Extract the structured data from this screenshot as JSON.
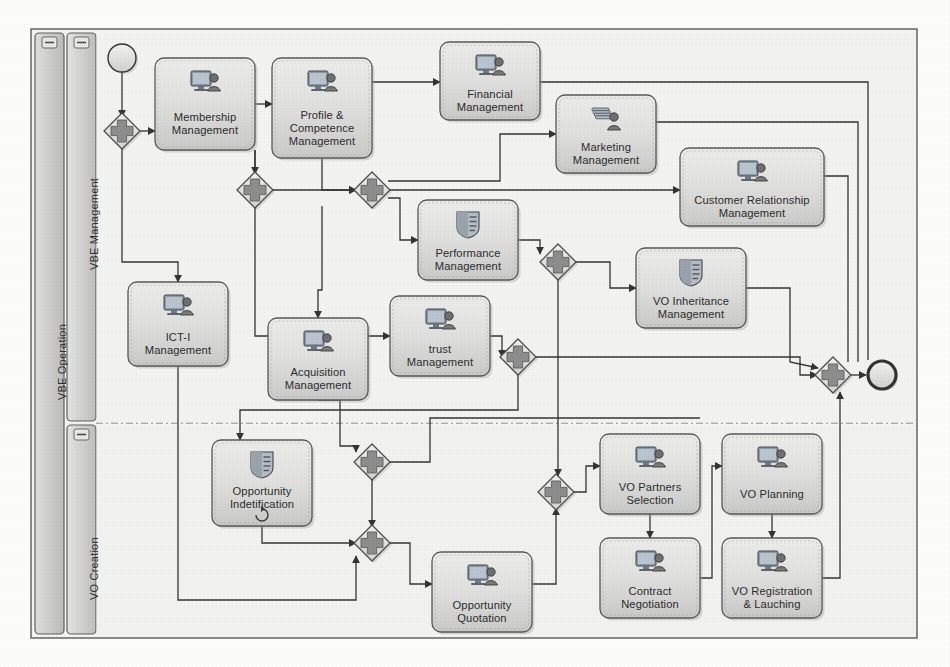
{
  "diagram": {
    "pool_label": "VBE Operation",
    "lanes": [
      {
        "id": "vbe-management",
        "label": "VBE Management"
      },
      {
        "id": "vo-creation",
        "label": "VO Creation"
      }
    ],
    "collapse_marker": "–",
    "colors": {
      "task_fill_top": "#e6e6e4",
      "task_fill_bottom": "#cfcfcd",
      "task_stroke": "#575757",
      "gateway_fill": "#e9e9e7",
      "gateway_stroke": "#4d4d4d",
      "gateway_plus": "#8a8a8a",
      "lane_fill": "#d8d8d6",
      "pool_fill": "#d2d2d0",
      "canvas_fill": "#f2f2f0",
      "connector": "#3a3a3a",
      "page_background": "#fdfdfc"
    }
  },
  "events": [
    {
      "id": "start",
      "type": "start-event",
      "name": "start-event",
      "cx": 122,
      "cy": 58,
      "r": 14
    },
    {
      "id": "end",
      "type": "end-event",
      "name": "end-event",
      "cx": 882,
      "cy": 375,
      "r": 14
    }
  ],
  "gateways": [
    {
      "id": "gw1",
      "name": "parallel-gateway-1",
      "cx": 122,
      "cy": 131,
      "symbol": "+"
    },
    {
      "id": "gw2",
      "name": "parallel-gateway-2",
      "cx": 255,
      "cy": 190,
      "symbol": "+"
    },
    {
      "id": "gw3",
      "name": "parallel-gateway-3",
      "cx": 372,
      "cy": 190,
      "symbol": "+"
    },
    {
      "id": "gw4",
      "name": "parallel-gateway-4",
      "cx": 558,
      "cy": 262,
      "symbol": "+"
    },
    {
      "id": "gw5",
      "name": "parallel-gateway-5",
      "cx": 518,
      "cy": 357,
      "symbol": "+"
    },
    {
      "id": "gw6",
      "name": "parallel-gateway-6",
      "cx": 372,
      "cy": 462,
      "symbol": "+"
    },
    {
      "id": "gw7",
      "name": "parallel-gateway-7",
      "cx": 372,
      "cy": 543,
      "symbol": "+"
    },
    {
      "id": "gw8",
      "name": "parallel-gateway-8",
      "cx": 556,
      "cy": 492,
      "symbol": "+"
    },
    {
      "id": "gw9",
      "name": "parallel-gateway-9",
      "cx": 833,
      "cy": 375,
      "symbol": "+"
    }
  ],
  "tasks": [
    {
      "id": "membership",
      "name": "task-membership-management",
      "label": "Membership\nManagement",
      "x": 155,
      "y": 58,
      "w": 100,
      "h": 92,
      "icon": "user-screen-icon"
    },
    {
      "id": "profile",
      "name": "task-profile-competence-management",
      "label": "Profile &\nCompetence\nManagement",
      "x": 272,
      "y": 58,
      "w": 100,
      "h": 100,
      "icon": "user-screen-icon"
    },
    {
      "id": "financial",
      "name": "task-financial-management",
      "label": "Financial\nManagement",
      "x": 440,
      "y": 42,
      "w": 100,
      "h": 78,
      "icon": "user-screen-icon"
    },
    {
      "id": "marketing",
      "name": "task-marketing-management",
      "label": "Marketing\nManagement",
      "x": 556,
      "y": 95,
      "w": 100,
      "h": 78,
      "icon": "documents-user-icon"
    },
    {
      "id": "crm",
      "name": "task-customer-relationship-management",
      "label": "Customer Relationship\nManagement",
      "x": 680,
      "y": 148,
      "w": 144,
      "h": 78,
      "icon": "user-screen-icon"
    },
    {
      "id": "performance",
      "name": "task-performance-management",
      "label": "Performance\nManagement",
      "x": 418,
      "y": 200,
      "w": 100,
      "h": 80,
      "icon": "server-shield-icon"
    },
    {
      "id": "voinherit",
      "name": "task-vo-inheritance-management",
      "label": "VO Inheritance\nManagement",
      "x": 636,
      "y": 248,
      "w": 110,
      "h": 80,
      "icon": "server-shield-icon"
    },
    {
      "id": "icti",
      "name": "task-ict-i-management",
      "label": "ICT-I\nManagement",
      "x": 128,
      "y": 282,
      "w": 100,
      "h": 84,
      "icon": "user-screen-icon"
    },
    {
      "id": "acquisition",
      "name": "task-acquisition-management",
      "label": "Acquisition\nManagement",
      "x": 268,
      "y": 318,
      "w": 100,
      "h": 82,
      "icon": "user-screen-icon"
    },
    {
      "id": "trust",
      "name": "task-trust-management",
      "label": "trust\nManagement",
      "x": 390,
      "y": 296,
      "w": 100,
      "h": 80,
      "icon": "user-screen-icon"
    },
    {
      "id": "opportunityid",
      "name": "task-opportunity-indetification",
      "label": "Opportunity\nIndetification",
      "x": 212,
      "y": 440,
      "w": 100,
      "h": 86,
      "icon": "server-shield-icon",
      "marker": "loop"
    },
    {
      "id": "opportunityq",
      "name": "task-opportunity-quotation",
      "label": "Opportunity\nQuotation",
      "x": 432,
      "y": 552,
      "w": 100,
      "h": 80,
      "icon": "user-screen-icon"
    },
    {
      "id": "vopartners",
      "name": "task-vo-partners-selection",
      "label": "VO Partners\nSelection",
      "x": 600,
      "y": 434,
      "w": 100,
      "h": 80,
      "icon": "user-screen-icon"
    },
    {
      "id": "contract",
      "name": "task-contract-negotiation",
      "label": "Contract\nNegotiation",
      "x": 600,
      "y": 538,
      "w": 100,
      "h": 80,
      "icon": "user-screen-icon"
    },
    {
      "id": "voplanning",
      "name": "task-vo-planning",
      "label": "VO Planning",
      "x": 722,
      "y": 434,
      "w": 100,
      "h": 80,
      "icon": "user-screen-icon"
    },
    {
      "id": "voregistration",
      "name": "task-vo-registration-lauching",
      "label": "VO Registration\n& Lauching",
      "x": 722,
      "y": 538,
      "w": 100,
      "h": 80,
      "icon": "user-screen-icon"
    }
  ],
  "flows": [
    {
      "name": "flow-start-to-gw1",
      "d": "M122,72 L122,117",
      "arrow": true
    },
    {
      "name": "flow-gw1-to-membership",
      "d": "M140,131 L155,131",
      "arrow": true
    },
    {
      "name": "flow-gw1-down-to-icti",
      "d": "M122,145 L122,262 L178,262 L178,282",
      "arrow": true
    },
    {
      "name": "flow-membership-to-profile",
      "d": "M255,104 L272,104",
      "arrow": true
    },
    {
      "name": "flow-profile-to-gw3",
      "d": "M322,158 L322,190 L356,190",
      "arrow": true
    },
    {
      "name": "flow-gw2-to-gw3",
      "d": "M271,190 L356,190",
      "arrow": true
    },
    {
      "name": "flow-gw2-from-top",
      "d": "M255,150 L255,174",
      "arrow": true
    },
    {
      "name": "flow-membership-down-to-gw2",
      "d": "M255,150 L255,174",
      "arrow": false
    },
    {
      "name": "flow-profile-to-financial",
      "d": "M372,82 L440,82",
      "arrow": true
    },
    {
      "name": "flow-gw3-to-marketing",
      "d": "M388,181 L500,181 L500,134 L556,134",
      "arrow": true
    },
    {
      "name": "flow-gw3-to-crm",
      "d": "M388,190 L680,190",
      "arrow": true
    },
    {
      "name": "flow-gw3-to-performance",
      "d": "M388,198 L400,198 L400,240 L418,240",
      "arrow": true
    },
    {
      "name": "flow-gw2-down-to-trust",
      "d": "M255,206 L255,336 L390,336",
      "arrow": true
    },
    {
      "name": "flow-profile-down-to-acquisition",
      "d": "M322,206 L322,290 L318,290 L318,318",
      "arrow": true
    },
    {
      "name": "flow-performance-to-gw4",
      "d": "M518,240 L540,240 L540,254",
      "arrow": true
    },
    {
      "name": "flow-gw4-to-voinherit",
      "d": "M574,262 L610,262 L610,288 L636,288",
      "arrow": true
    },
    {
      "name": "flow-trust-to-gw5",
      "d": "M490,336 L502,336 L502,357",
      "arrow": true
    },
    {
      "name": "flow-financial-right",
      "d": "M540,82 L868,82 L868,360",
      "arrow": false
    },
    {
      "name": "flow-marketing-right",
      "d": "M656,122 L858,122 L858,362",
      "arrow": false
    },
    {
      "name": "flow-crm-right",
      "d": "M824,176 L848,176 L848,362",
      "arrow": false
    },
    {
      "name": "flow-voinherit-to-gw9",
      "d": "M746,288 L790,288 L790,362 L818,368",
      "arrow": true
    },
    {
      "name": "flow-gw5-to-gw9",
      "d": "M534,357 L800,357 L800,375 L817,375",
      "arrow": true
    },
    {
      "name": "flow-gw4-down",
      "d": "M558,278 L558,476",
      "arrow": true
    },
    {
      "name": "flow-gw5-down",
      "d": "M518,373 L518,410 L240,410 L240,440",
      "arrow": true
    },
    {
      "name": "flow-acquisition-to-gw6",
      "d": "M318,400 L340,400 L340,446 L356,446 L356,452",
      "arrow": true
    },
    {
      "name": "flow-icti-down-to-bottom",
      "d": "M178,366 L178,600 L356,600 L356,556",
      "arrow": true
    },
    {
      "name": "flow-gw6-to-right",
      "d": "M388,462 L430,462 L430,418 L700,418",
      "arrow": false
    },
    {
      "name": "flow-gw6-to-gw7",
      "d": "M372,478 L372,527",
      "arrow": true
    },
    {
      "name": "flow-opid-to-gw7",
      "d": "M262,526 L262,543 L356,543",
      "arrow": true
    },
    {
      "name": "flow-gw7-to-quotation",
      "d": "M388,543 L410,543 L410,584 L432,584",
      "arrow": true
    },
    {
      "name": "flow-quotation-to-gw8",
      "d": "M532,584 L556,584 L556,508",
      "arrow": true
    },
    {
      "name": "flow-gw8-to-vopartners",
      "d": "M572,492 L586,492 L586,466 L600,466",
      "arrow": true
    },
    {
      "name": "flow-vopartners-to-contract",
      "d": "M650,514 L650,538",
      "arrow": true
    },
    {
      "name": "flow-contract-to-voplanning",
      "d": "M700,578 L712,578 L712,466 L722,466",
      "arrow": true
    },
    {
      "name": "flow-voplanning-to-voregistration",
      "d": "M772,514 L772,538",
      "arrow": true
    },
    {
      "name": "flow-voregistration-to-gw9",
      "d": "M822,578 L840,578 L840,392",
      "arrow": true
    },
    {
      "name": "flow-gw9-to-end",
      "d": "M849,375 L866,375",
      "arrow": true
    }
  ]
}
